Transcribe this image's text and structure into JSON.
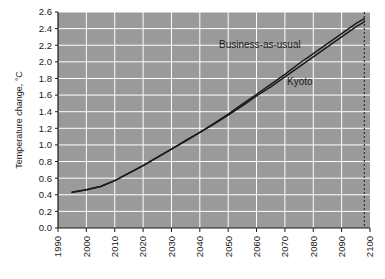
{
  "chart_data": {
    "type": "line",
    "title": "",
    "xlabel": "",
    "ylabel": "Temperature change, °C",
    "xlim": [
      1990,
      2100
    ],
    "ylim": [
      0.0,
      2.6
    ],
    "grid": true,
    "legend_position": "inline-annotation",
    "xticks": [
      "1990",
      "2000",
      "2010",
      "2020",
      "2030",
      "2040",
      "2050",
      "2060",
      "2070",
      "2080",
      "2090",
      "2100"
    ],
    "yticks": [
      "0.0",
      "0.2",
      "0.4",
      "0.6",
      "0.8",
      "1.0",
      "1.2",
      "1.4",
      "1.6",
      "1.8",
      "2.0",
      "2.2",
      "2.4",
      "2.6"
    ],
    "x": [
      1995,
      2000,
      2005,
      2010,
      2015,
      2020,
      2025,
      2030,
      2035,
      2040,
      2045,
      2050,
      2055,
      2060,
      2065,
      2070,
      2075,
      2080,
      2085,
      2090,
      2095,
      2098
    ],
    "series": [
      {
        "name": "Business-as-usual",
        "color": "#1a1a1a",
        "values": [
          0.43,
          0.46,
          0.5,
          0.57,
          0.66,
          0.75,
          0.85,
          0.95,
          1.05,
          1.15,
          1.26,
          1.37,
          1.49,
          1.61,
          1.73,
          1.85,
          1.98,
          2.1,
          2.22,
          2.34,
          2.46,
          2.52
        ]
      },
      {
        "name": "Kyoto",
        "color": "#1a1a1a",
        "values": [
          0.43,
          0.46,
          0.5,
          0.57,
          0.66,
          0.75,
          0.85,
          0.95,
          1.05,
          1.15,
          1.25,
          1.36,
          1.47,
          1.59,
          1.7,
          1.82,
          1.94,
          2.06,
          2.18,
          2.3,
          2.42,
          2.48
        ]
      }
    ],
    "annotations": [
      {
        "label": "Business-as-usual",
        "x_px": 219,
        "y_px": 48
      },
      {
        "label": "Kyoto",
        "x_px": 287,
        "y_px": 85
      }
    ],
    "reference_line": {
      "name": "year-2098-marker",
      "x": 2098,
      "style": "dashed"
    },
    "colors": {
      "plot_background": "#9a9a9a",
      "gridline": "#ffffff",
      "axis": "#1a1a1a",
      "page_background": "#ffffff",
      "series_line": "#1a1a1a"
    }
  }
}
